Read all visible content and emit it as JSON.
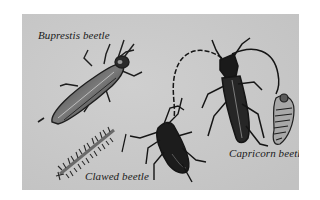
{
  "illustration": {
    "background_color": "#c9c9c9",
    "ink_color": "#1a1a1a",
    "captions": {
      "buprestis": "Buprestis beetle",
      "clawed": "Clawed beetle",
      "capricorn": "Capricorn beetle"
    }
  }
}
